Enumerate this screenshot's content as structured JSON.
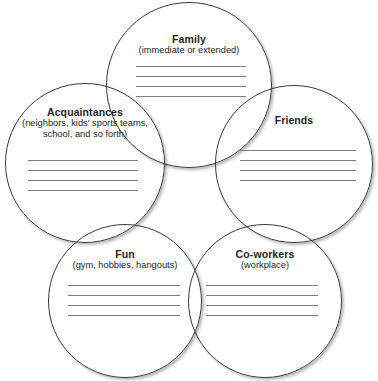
{
  "document": {
    "type": "worksheet-diagram",
    "shape": "five-overlapping-circles",
    "colors": {
      "circle_outline": "#3a3a3a",
      "rule_line": "#7e7e7e",
      "text": "#231f20",
      "background": "#ffffff"
    }
  },
  "circles": [
    {
      "id": "family",
      "title": "Family",
      "subtitle": "(immediate or extended)",
      "position": "top",
      "write_in_lines": 4
    },
    {
      "id": "acquaintances",
      "title": "Acquaintances",
      "subtitle": "(neighbors, kids' sports teams, school, and so forth)",
      "position": "upper-left",
      "write_in_lines": 4
    },
    {
      "id": "friends",
      "title": "Friends",
      "subtitle": "",
      "position": "upper-right",
      "write_in_lines": 4
    },
    {
      "id": "fun",
      "title": "Fun",
      "subtitle": "(gym, hobbies, hangouts)",
      "position": "lower-left",
      "write_in_lines": 4
    },
    {
      "id": "coworkers",
      "title": "Co-workers",
      "subtitle": "(workplace)",
      "position": "lower-right",
      "write_in_lines": 4
    }
  ]
}
